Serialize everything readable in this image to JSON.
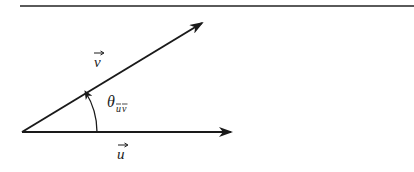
{
  "diagram": {
    "type": "vector-angle",
    "top_rule": {
      "x1": 20,
      "y1": 6,
      "x2": 414,
      "y2": 6,
      "color": "#555555"
    },
    "origin": {
      "x": 22,
      "y": 132
    },
    "vectors": [
      {
        "id": "u",
        "label": "u",
        "has_arrow_accent": true,
        "tip": {
          "x": 231,
          "y": 132
        }
      },
      {
        "id": "v",
        "label": "v",
        "has_arrow_accent": true,
        "tip": {
          "x": 202,
          "y": 23
        }
      }
    ],
    "angle": {
      "symbol": "θ",
      "subscript": "uv",
      "subscript_has_arrow_accents": true,
      "from": "u",
      "to": "v"
    },
    "stroke_color": "#1a1a1a"
  },
  "labels": {
    "v": "v",
    "u": "u",
    "theta": "θ",
    "theta_sub_u": "u",
    "theta_sub_v": "v"
  }
}
